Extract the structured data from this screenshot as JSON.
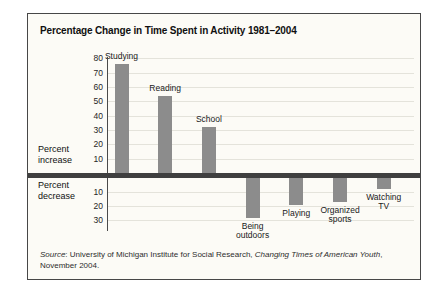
{
  "figure": {
    "title": "Percentage Change in Time Spent in Activity 1981–2004"
  },
  "axis": {
    "increase_label_line1": "Percent",
    "increase_label_line2": "increase",
    "decrease_label_line1": "Percent",
    "decrease_label_line2": "decrease",
    "increase_ticks": [
      80,
      70,
      60,
      50,
      40,
      30,
      20,
      10
    ],
    "decrease_ticks": [
      10,
      20,
      30
    ]
  },
  "chart_data": {
    "type": "bar",
    "title": "Percentage Change in Time Spent in Activity 1981–2004",
    "categories": [
      "Studying",
      "Reading",
      "School",
      "Being outdoors",
      "Playing",
      "Organized sports",
      "Watching TV"
    ],
    "categories_lines": [
      [
        "Studying"
      ],
      [
        "Reading"
      ],
      [
        "School"
      ],
      [
        "Being",
        "outdoors"
      ],
      [
        "Playing"
      ],
      [
        "Organized",
        "sports"
      ],
      [
        "Watching",
        "TV"
      ]
    ],
    "values": [
      76,
      54,
      32,
      -28,
      -19,
      -17,
      -8
    ],
    "xlabel": "",
    "ylabel_positive": "Percent increase",
    "ylabel_negative": "Percent decrease",
    "ylim": [
      -30,
      80
    ],
    "grid": true,
    "legend": "none",
    "bar_color": "#8c8c8c",
    "source_line1_parts": {
      "source_word_italic": "Source",
      "after_source": ": University of Michigan Institute for Social Research, ",
      "work_title_italic": "Changing Times of American Youth",
      "after_work": ","
    },
    "source_line2": "November 2004."
  }
}
